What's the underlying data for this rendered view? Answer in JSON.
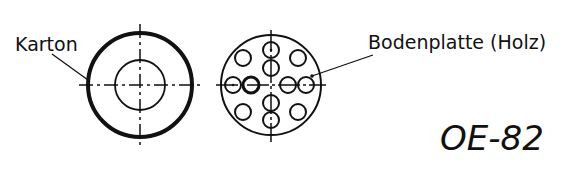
{
  "labels": {
    "left": "Karton",
    "right": "Bodenplatte (Holz)",
    "code": "OE-82"
  },
  "colors": {
    "line": "#111111",
    "background": "#ffffff"
  }
}
